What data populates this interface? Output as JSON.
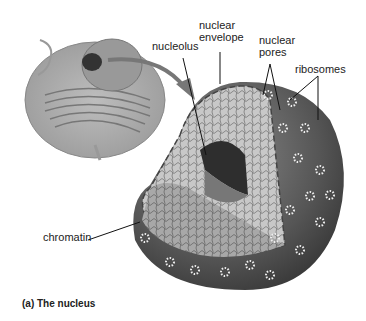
{
  "figure": {
    "caption": "(a) The nucleus",
    "labels": {
      "nucleolus": "nucleolus",
      "nuclear_envelope_1": "nuclear",
      "nuclear_envelope_2": "envelope",
      "nuclear_pores_1": "nuclear",
      "nuclear_pores_2": "pores",
      "ribosomes": "ribosomes",
      "chromatin": "chromatin"
    }
  }
}
